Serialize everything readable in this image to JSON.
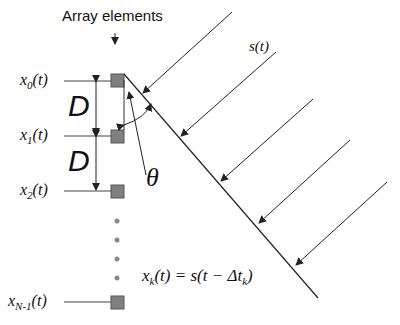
{
  "diagram": {
    "title": "Array elements",
    "signal_label": "s(t)",
    "spacing_label": "D",
    "angle_label": "θ",
    "elements": [
      {
        "label_main": "x",
        "label_sub": "0",
        "label_tail": "(t)"
      },
      {
        "label_main": "x",
        "label_sub": "1",
        "label_tail": "(t)"
      },
      {
        "label_main": "x",
        "label_sub": "2",
        "label_tail": "(t)"
      },
      {
        "label_main": "x",
        "label_sub": "N-1",
        "label_tail": "(t)"
      }
    ],
    "equation": {
      "lhs_main": "x",
      "lhs_sub": "k",
      "lhs_tail": "(t) = s(t − Δt",
      "rhs_sub": "k",
      "rhs_tail": ")"
    },
    "colors": {
      "element_fill": "#808080",
      "element_stroke": "#555555",
      "line": "#222222",
      "dots": "#888888"
    }
  }
}
